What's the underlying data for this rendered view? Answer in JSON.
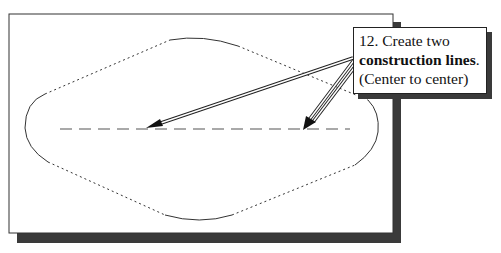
{
  "callout": {
    "line1": "12. Create two",
    "line2_bold": "construction lines",
    "line2_suffix": ".",
    "line3": "(Center to center)"
  },
  "colors": {
    "frame_border": "#333333",
    "shadow": "#3a3a3a",
    "outline": "#333333",
    "construction_line": "#555555"
  }
}
